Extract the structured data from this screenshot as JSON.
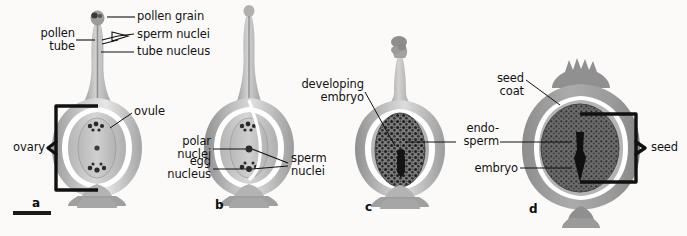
{
  "figure": {
    "background_color": "#fbfaf8",
    "ink_color": "#131313",
    "bracket_color": "#111111",
    "tissue_light": "#d9d9d9",
    "tissue_mid": "#a8a8a8",
    "tissue_dark": "#8a8a8a",
    "endosperm_fill": "#6e6e6e",
    "embryo_fill": "#1c1c1c"
  },
  "panels": [
    {
      "letter": "a",
      "name": "pollen-tube-growth",
      "labels": [
        {
          "key": "pollen_grain",
          "text": "pollen grain"
        },
        {
          "key": "sperm_nuclei",
          "text": "sperm nuclei"
        },
        {
          "key": "tube_nucleus",
          "text": "tube nucleus"
        },
        {
          "key": "pollen_tube",
          "text": "pollen\ntube"
        },
        {
          "key": "ovule",
          "text": "ovule"
        },
        {
          "key": "ovary",
          "text": "ovary"
        }
      ],
      "bracket": "ovary"
    },
    {
      "letter": "b",
      "name": "fertilization",
      "labels": [
        {
          "key": "polar_nuclei",
          "text": "polar\nnuclei"
        },
        {
          "key": "egg_nucleus",
          "text": "egg\nnucleus"
        },
        {
          "key": "sperm_nuclei",
          "text": "sperm\nnuclei"
        }
      ],
      "bracket": null
    },
    {
      "letter": "c",
      "name": "developing-embryo",
      "labels": [
        {
          "key": "developing_embryo",
          "text": "developing\nembryo"
        },
        {
          "key": "endosperm",
          "text": "endo-\nsperm"
        }
      ],
      "bracket": null
    },
    {
      "letter": "d",
      "name": "mature-seed",
      "labels": [
        {
          "key": "seed_coat",
          "text": "seed\ncoat"
        },
        {
          "key": "endosperm",
          "text": "endo-\nsperm"
        },
        {
          "key": "embryo",
          "text": "embryo"
        },
        {
          "key": "seed",
          "text": "seed"
        }
      ],
      "bracket": "seed"
    }
  ],
  "scale_bar": {
    "name": "scale-bar",
    "text": ""
  }
}
